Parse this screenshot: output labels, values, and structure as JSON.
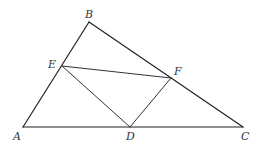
{
  "diagram": {
    "type": "geometry-triangle",
    "points": {
      "A": {
        "x": 23,
        "y": 127
      },
      "B": {
        "x": 89,
        "y": 22
      },
      "C": {
        "x": 243,
        "y": 127
      },
      "D": {
        "x": 130,
        "y": 127
      },
      "E": {
        "x": 62,
        "y": 66
      },
      "F": {
        "x": 171,
        "y": 78
      }
    },
    "labels": {
      "A": "A",
      "B": "B",
      "C": "C",
      "D": "D",
      "E": "E",
      "F": "F"
    },
    "segments": [
      [
        "A",
        "B"
      ],
      [
        "B",
        "C"
      ],
      [
        "A",
        "C"
      ],
      [
        "E",
        "F"
      ],
      [
        "E",
        "D"
      ],
      [
        "D",
        "F"
      ]
    ],
    "colors": {
      "line": "#222222",
      "label": "#333333",
      "background": "#ffffff"
    }
  }
}
